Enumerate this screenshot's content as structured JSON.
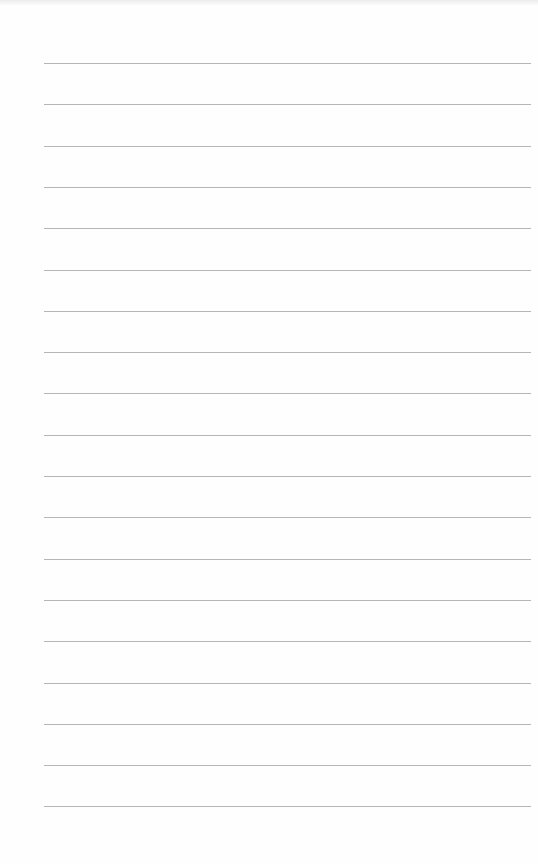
{
  "page": {
    "type": "lined-paper",
    "background_color": "#fefefe",
    "rule_color": "#a9a9a9",
    "rule_count": 19,
    "rule_left_px": 44,
    "rule_right_px": 531,
    "first_rule_y_px": 63,
    "rule_spacing_px": 41.3,
    "text_lines": []
  }
}
